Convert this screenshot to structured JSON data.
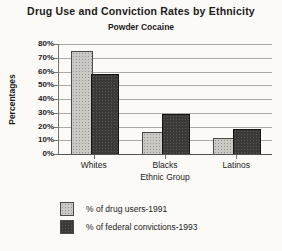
{
  "title": "Drug Use and Conviction Rates by Ethnicity",
  "subtitle": "Powder Cocaine",
  "chart_data": {
    "type": "bar",
    "categories": [
      "Whites",
      "Blacks",
      "Latinos"
    ],
    "series": [
      {
        "name": "% of drug users-1991",
        "values": [
          75,
          16,
          12
        ],
        "color": "#cac9c4",
        "border": "#4a4a46"
      },
      {
        "name": "% of federal convictions-1993",
        "values": [
          58,
          29,
          18
        ],
        "color": "#3b3a38",
        "border": "#141414"
      }
    ],
    "xlabel": "Ethnic Group",
    "ylabel": "Percentages",
    "ylim": [
      0,
      80
    ],
    "ytick_step": 10,
    "ytick_labels": [
      "0%",
      "10%",
      "20%",
      "30%",
      "40%",
      "50%",
      "60%",
      "70%",
      "80%"
    ],
    "grid": true,
    "legend_position": "bottom-left"
  }
}
